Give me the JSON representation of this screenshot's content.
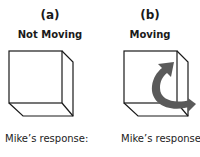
{
  "panels": [
    {
      "letter": "(a)",
      "title": "Not Moving",
      "response_label": "Mike’s response:",
      "motion": "none"
    },
    {
      "letter": "(b)",
      "title": "Moving",
      "response_label": "Mike’s response:",
      "motion": "curved-arrow"
    }
  ],
  "colors": {
    "line": "#1a1a1a",
    "arrow": "#5a5a5a"
  }
}
